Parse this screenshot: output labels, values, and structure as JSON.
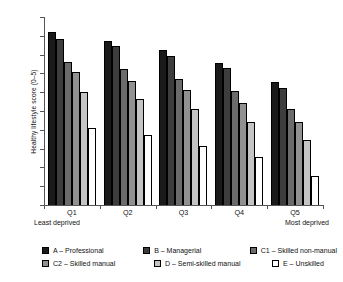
{
  "chart_data": {
    "type": "bar",
    "title": "",
    "xlabel": "",
    "ylabel": "Healthy lifestyle score (0–5)",
    "ylim": [
      2.0,
      3.0
    ],
    "ytick_step": 0.1,
    "ytick_labels": [
      "3.0",
      "2.9",
      "2.8",
      "2.7",
      "2.6",
      "2.5",
      "2.4",
      "2.3",
      "2.2",
      "2.1",
      "2.0"
    ],
    "grid": false,
    "legend_position": "bottom",
    "categories": [
      "Q1",
      "Q2",
      "Q3",
      "Q4",
      "Q5"
    ],
    "category_annotations": {
      "left": "Least deprived",
      "right": "Most deprived"
    },
    "series": [
      {
        "name": "A – Professional",
        "color": "#1a1a1a",
        "border": "#000000",
        "values": [
          2.92,
          2.875,
          2.825,
          2.755,
          2.655
        ]
      },
      {
        "name": "B – Managerial",
        "color": "#3d3d3d",
        "border": "#000000",
        "values": [
          2.885,
          2.845,
          2.79,
          2.73,
          2.625
        ]
      },
      {
        "name": "C1 – Skilled non-manual",
        "color": "#6b6b6b",
        "border": "#000000",
        "values": [
          2.76,
          2.725,
          2.67,
          2.605,
          2.51
        ]
      },
      {
        "name": "C2 – Skilled manual",
        "color": "#919191",
        "border": "#000000",
        "values": [
          2.705,
          2.66,
          2.61,
          2.545,
          2.44
        ]
      },
      {
        "name": "D – Semi-skilled manual",
        "color": "#c4c4c4",
        "border": "#000000",
        "values": [
          2.6,
          2.565,
          2.51,
          2.44,
          2.345
        ]
      },
      {
        "name": "E – Unskilled",
        "color": "#ffffff",
        "border": "#000000",
        "values": [
          2.41,
          2.37,
          2.315,
          2.255,
          2.155
        ]
      }
    ]
  }
}
